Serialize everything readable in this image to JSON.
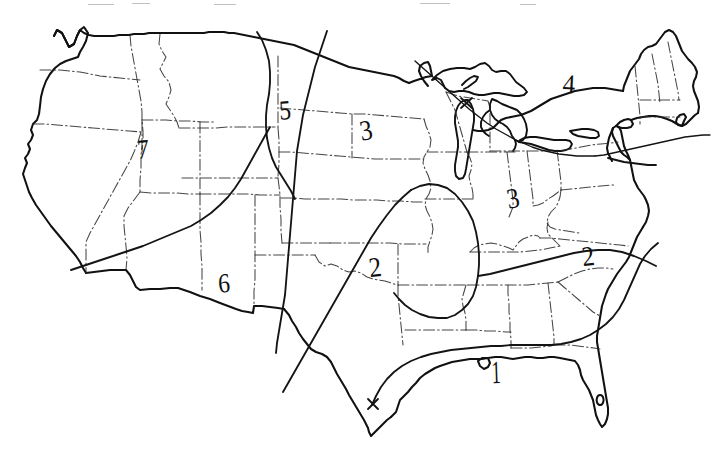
{
  "figure": {
    "kind": "hand-drawn-map",
    "background_color": "#ffffff",
    "ink_color": "#111111",
    "width": 717,
    "height": 458
  },
  "map": {
    "region_name": "Contiguous United States",
    "boundary_style_state": "dash-dot",
    "boundary_style_coast": "solid",
    "features": [
      "national-coastline",
      "state-boundaries",
      "great-lakes",
      "zone-isolines"
    ]
  },
  "zone_labels": [
    {
      "id": "zone-1",
      "text": "1",
      "x": 496,
      "y": 372,
      "tilt": "tilt-e",
      "region": "gulf-coast"
    },
    {
      "id": "zone-2-central",
      "text": "2",
      "x": 375,
      "y": 267,
      "tilt": "tilt-a",
      "region": "south-central"
    },
    {
      "id": "zone-2-east",
      "text": "2",
      "x": 588,
      "y": 256,
      "tilt": "tilt-a",
      "region": "southeast-atlantic"
    },
    {
      "id": "zone-3-plains",
      "text": "3",
      "x": 366,
      "y": 130,
      "tilt": "tilt-c",
      "region": "northern-plains"
    },
    {
      "id": "zone-3-ohio",
      "text": "3",
      "x": 513,
      "y": 198,
      "tilt": "tilt-c",
      "region": "ohio-valley"
    },
    {
      "id": "zone-4",
      "text": "4",
      "x": 569,
      "y": 84,
      "tilt": "tilt-d",
      "region": "northeast"
    },
    {
      "id": "zone-5",
      "text": "5",
      "x": 285,
      "y": 110,
      "tilt": "tilt-b",
      "region": "northern-rockies"
    },
    {
      "id": "zone-6",
      "text": "6",
      "x": 224,
      "y": 283,
      "tilt": "tilt-b",
      "region": "southwest"
    },
    {
      "id": "zone-7",
      "text": "7",
      "x": 143,
      "y": 149,
      "tilt": "tilt-b",
      "region": "great-basin"
    }
  ],
  "legend": {
    "present": false,
    "note": ""
  },
  "axes": {
    "present": false
  }
}
